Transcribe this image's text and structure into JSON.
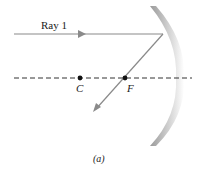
{
  "diagram": {
    "ray_label": "Ray 1",
    "points": [
      {
        "name": "C",
        "label": "C"
      },
      {
        "name": "F",
        "label": "F"
      }
    ],
    "caption": "(a)",
    "colors": {
      "ray": "#8a8a8a",
      "axis": "#333333",
      "mirror": "#a0a0a0",
      "point": "#111111"
    }
  }
}
